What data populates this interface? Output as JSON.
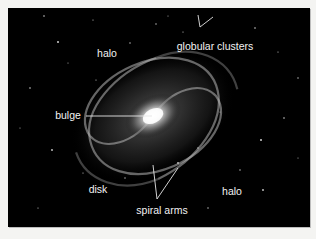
{
  "figure": {
    "background_color": "#000000",
    "label_color": "#f2f2f2",
    "labels": [
      {
        "id": "halo-top",
        "text": "halo",
        "x": 99,
        "y": 45
      },
      {
        "id": "globular-clusters",
        "text": "globular clusters",
        "x": 207,
        "y": 38
      },
      {
        "id": "bulge",
        "text": "bulge",
        "x": 66,
        "y": 107
      },
      {
        "id": "disk",
        "text": "disk",
        "x": 90,
        "y": 181
      },
      {
        "id": "spiral-arms",
        "text": "spiral arms",
        "x": 154,
        "y": 202
      },
      {
        "id": "halo-bottom",
        "text": "halo",
        "x": 224,
        "y": 183
      }
    ]
  }
}
